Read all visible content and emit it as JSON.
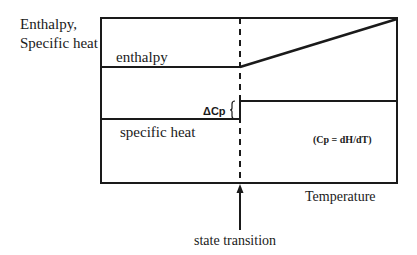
{
  "diagram": {
    "y_axis_label_line1": "Enthalpy,",
    "y_axis_label_line2": "Specific heat",
    "x_axis_label": "Temperature",
    "enthalpy_label": "enthalpy",
    "specific_heat_label": "specific heat",
    "delta_cp_label": "ΔCp",
    "formula_label": "(Cp = dH/dT)",
    "transition_label": "state transition",
    "colors": {
      "line": "#1a1a1a",
      "background": "#ffffff"
    }
  }
}
